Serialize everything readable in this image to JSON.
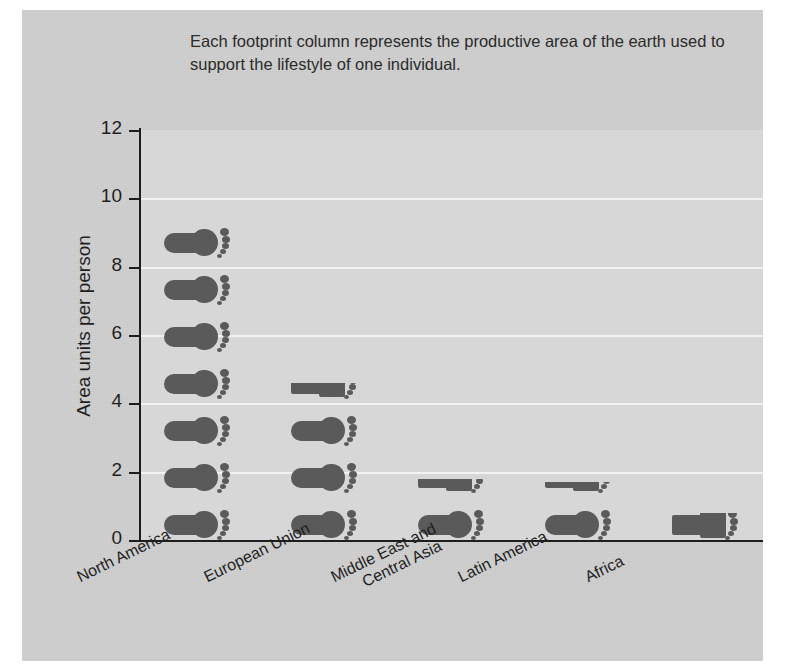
{
  "caption": "Each footprint column represents the productive area of the earth used to support the lifestyle of one individual.",
  "colors": {
    "figure_background": "#cfcfcf",
    "plot_background": "#d7d7d7",
    "gridline": "#f2f2f2",
    "axis": "#1d1d1d",
    "footprint": "#5a5a5a",
    "text": "#1f1f1f"
  },
  "chart_data": {
    "type": "bar",
    "title": "",
    "subtitle": "",
    "xlabel": "",
    "ylabel": "Area units per person",
    "ylim": [
      0,
      12
    ],
    "yticks": [
      0,
      2,
      4,
      6,
      8,
      10,
      12
    ],
    "grid": true,
    "legend": false,
    "unit_glyph": "footprint",
    "categories": [
      "North America",
      "European Union",
      "Middle East and Central Asia",
      "Latin America",
      "Africa"
    ],
    "values": [
      9.4,
      4.6,
      1.8,
      1.7,
      0.8
    ],
    "footprint_counts": [
      8,
      4,
      2,
      2,
      1
    ],
    "annotation": "Each footprint column represents the productive area of the earth used to support the lifestyle of one individual."
  },
  "x_axis_labels": [
    {
      "line1": "North America",
      "line2": ""
    },
    {
      "line1": "European Union",
      "line2": ""
    },
    {
      "line1": "Middle East and",
      "line2": "Central Asia"
    },
    {
      "line1": "Latin America",
      "line2": ""
    },
    {
      "line1": "Africa",
      "line2": ""
    }
  ],
  "y_tick_labels": [
    "0",
    "2",
    "4",
    "6",
    "8",
    "10",
    "12"
  ]
}
